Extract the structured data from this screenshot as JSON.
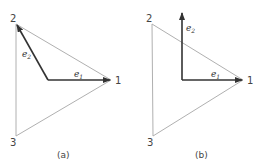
{
  "panels": [
    {
      "id": "a",
      "caption": "(a)",
      "vertices": [
        {
          "label": "1",
          "x": 111,
          "y": 80
        },
        {
          "label": "2",
          "x": 16,
          "y": 24
        },
        {
          "label": "3",
          "x": 16,
          "y": 136
        }
      ],
      "origin": {
        "x": 48,
        "y": 80
      },
      "vectors": [
        {
          "name": "e",
          "sub": "1",
          "to": {
            "x": 111,
            "y": 80
          }
        },
        {
          "name": "e",
          "sub": "2",
          "to": {
            "x": 16,
            "y": 24
          }
        }
      ]
    },
    {
      "id": "b",
      "caption": "(b)",
      "vertices": [
        {
          "label": "1",
          "x": 243,
          "y": 80
        },
        {
          "label": "2",
          "x": 152,
          "y": 24
        },
        {
          "label": "3",
          "x": 153,
          "y": 136
        }
      ],
      "origin": {
        "x": 182,
        "y": 80
      },
      "vectors": [
        {
          "name": "e",
          "sub": "1",
          "to": {
            "x": 243,
            "y": 80
          }
        },
        {
          "name": "e",
          "sub": "2",
          "to": {
            "x": 182,
            "y": 12
          }
        }
      ]
    }
  ],
  "colors": {
    "triangle": "#b0b0b0",
    "vector": "#333333",
    "text": "#444444"
  }
}
